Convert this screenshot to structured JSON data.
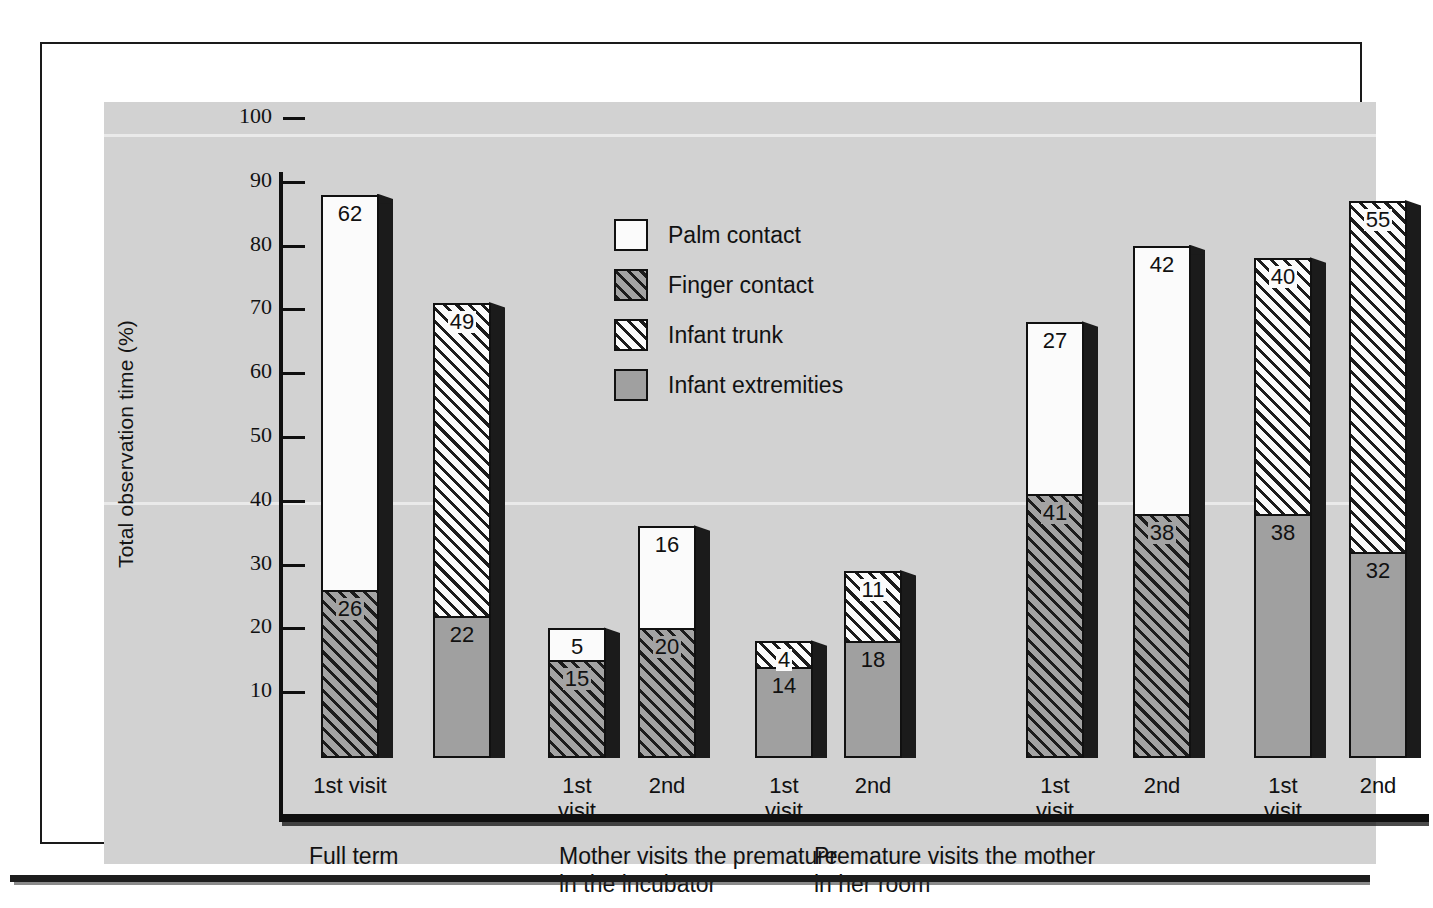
{
  "figure": {
    "y_axis_title": "Total observation time (%)"
  },
  "chart_data": {
    "type": "bar",
    "subtype": "stacked-bar-3d",
    "title": "",
    "xlabel": "",
    "ylabel": "Total observation time (%)",
    "ylim": [
      0,
      100
    ],
    "yticks": [
      10,
      20,
      30,
      40,
      50,
      60,
      70,
      80,
      90,
      100
    ],
    "ytick_labels": [
      "10",
      "20",
      "30",
      "40",
      "50",
      "60",
      "70",
      "80",
      "90",
      "100"
    ],
    "grid": false,
    "legend_position": "upper-center",
    "legend": [
      {
        "name": "Palm contact",
        "swatch": "fill-palm"
      },
      {
        "name": "Finger contact",
        "swatch": "fill-finger"
      },
      {
        "name": "Infant trunk",
        "swatch": "fill-trunk"
      },
      {
        "name": "Infant extremities",
        "swatch": "fill-extrem"
      }
    ],
    "groups": [
      {
        "label": "Full term",
        "bars": [
          {
            "tick_label": "1st visit",
            "segments": [
              {
                "series": "Finger contact",
                "value": 26,
                "fill": "fill-finger"
              },
              {
                "series": "Palm contact",
                "value": 62,
                "fill": "fill-palm"
              }
            ],
            "total": 88
          },
          {
            "tick_label": "",
            "segments": [
              {
                "series": "Infant extremities",
                "value": 22,
                "fill": "fill-extrem"
              },
              {
                "series": "Infant trunk",
                "value": 49,
                "fill": "fill-trunk"
              }
            ],
            "total": 71
          }
        ]
      },
      {
        "label": "Mother visits the premature\nin the incubator",
        "bars": [
          {
            "tick_label": "1st\nvisit",
            "segments": [
              {
                "series": "Finger contact",
                "value": 15,
                "fill": "fill-finger"
              },
              {
                "series": "Palm contact",
                "value": 5,
                "fill": "fill-palm"
              }
            ],
            "total": 20
          },
          {
            "tick_label": "2nd",
            "segments": [
              {
                "series": "Finger contact",
                "value": 20,
                "fill": "fill-finger"
              },
              {
                "series": "Palm contact",
                "value": 16,
                "fill": "fill-palm"
              }
            ],
            "total": 36
          },
          {
            "tick_label": "1st\nvisit",
            "segments": [
              {
                "series": "Infant extremities",
                "value": 14,
                "fill": "fill-extrem"
              },
              {
                "series": "Infant trunk",
                "value": 4,
                "fill": "fill-trunk"
              }
            ],
            "total": 18
          },
          {
            "tick_label": "2nd",
            "segments": [
              {
                "series": "Infant extremities",
                "value": 18,
                "fill": "fill-extrem"
              },
              {
                "series": "Infant trunk",
                "value": 11,
                "fill": "fill-trunk"
              }
            ],
            "total": 29
          }
        ]
      },
      {
        "label": "Premature visits the mother\nin her room",
        "bars": [
          {
            "tick_label": "1st\nvisit",
            "segments": [
              {
                "series": "Finger contact",
                "value": 41,
                "fill": "fill-finger"
              },
              {
                "series": "Palm contact",
                "value": 27,
                "fill": "fill-palm"
              }
            ],
            "total": 68
          },
          {
            "tick_label": "2nd",
            "segments": [
              {
                "series": "Finger contact",
                "value": 38,
                "fill": "fill-finger"
              },
              {
                "series": "Palm contact",
                "value": 42,
                "fill": "fill-palm"
              }
            ],
            "total": 80
          },
          {
            "tick_label": "1st\nvisit",
            "segments": [
              {
                "series": "Infant extremities",
                "value": 38,
                "fill": "fill-extrem"
              },
              {
                "series": "Infant trunk",
                "value": 40,
                "fill": "fill-trunk"
              }
            ],
            "total": 78
          },
          {
            "tick_label": "2nd",
            "segments": [
              {
                "series": "Infant extremities",
                "value": 32,
                "fill": "fill-extrem"
              },
              {
                "series": "Infant trunk",
                "value": 55,
                "fill": "fill-trunk"
              }
            ],
            "total": 87
          }
        ]
      }
    ]
  },
  "colors": {
    "panel_background": "#d2d2d2",
    "ink": "#111111",
    "shadow": "#1b1b1b",
    "finger_base": "#a3a3a3",
    "extremities": "#a0a0a0",
    "palm": "#fbfbfb"
  },
  "layout": {
    "bar_x": [
      217,
      329,
      444,
      534,
      651,
      740,
      922,
      1029,
      1150,
      1245
    ],
    "bar_width": 58,
    "group_label_x": [
      205,
      455,
      710
    ],
    "tick_label_x": [
      217,
      0,
      444,
      534,
      651,
      740,
      922,
      1029,
      1150,
      1245
    ]
  }
}
